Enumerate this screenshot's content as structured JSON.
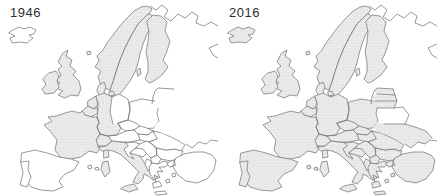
{
  "figure": {
    "type": "choropleth-map-pair",
    "colors": {
      "background": "#ffffff",
      "shaded_fill": "#ebebeb",
      "stipple_dot": "#cdcdcd",
      "border_line": "#6f6f6f",
      "year_label": "#2e2e2e",
      "unshaded_fill": "#ffffff"
    },
    "panels": [
      {
        "label": "1946",
        "shaded_regions": [
          "united-kingdom",
          "ireland",
          "france",
          "belgium",
          "netherlands",
          "denmark",
          "norway",
          "sweden",
          "finland",
          "switzerland",
          "italy",
          "germany-west"
        ],
        "unshaded_regions": [
          "iceland",
          "spain",
          "portugal",
          "germany-east",
          "poland",
          "czechia",
          "slovakia",
          "austria",
          "hungary",
          "croatia",
          "bosnia",
          "serbia",
          "macedonia",
          "albania",
          "greece",
          "romania",
          "bulgaria",
          "turkey",
          "estonia",
          "latvia",
          "lithuania",
          "belarus",
          "ukraine",
          "russia"
        ],
        "internal_borders": {
          "post_soviet_states": false,
          "inner_german": true
        }
      },
      {
        "label": "2016",
        "shaded_regions": [
          "iceland",
          "united-kingdom",
          "ireland",
          "france",
          "belgium",
          "netherlands",
          "denmark",
          "norway",
          "sweden",
          "finland",
          "switzerland",
          "italy",
          "germany-west",
          "germany-east",
          "spain",
          "portugal",
          "poland",
          "czechia",
          "slovakia",
          "austria",
          "hungary",
          "croatia",
          "bosnia",
          "serbia",
          "macedonia",
          "albania",
          "greece",
          "bulgaria",
          "romania",
          "turkey",
          "estonia",
          "latvia",
          "lithuania",
          "ukraine"
        ],
        "unshaded_regions": [
          "belarus",
          "russia"
        ],
        "internal_borders": {
          "post_soviet_states": true,
          "inner_german": false
        }
      }
    ]
  }
}
